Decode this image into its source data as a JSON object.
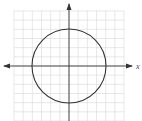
{
  "figure": {
    "type": "coordinate-plane-with-circle",
    "x_axis_label": "x",
    "y_axis_label": "",
    "grid": {
      "cells_x": 12,
      "cells_y": 12,
      "color": "#d8d8d8"
    },
    "axes": {
      "color": "#333333",
      "x_range": [
        -6,
        6
      ],
      "y_range": [
        -6,
        6
      ]
    },
    "circle": {
      "center": [
        0,
        0
      ],
      "radius": 4,
      "color": "#333333"
    }
  }
}
